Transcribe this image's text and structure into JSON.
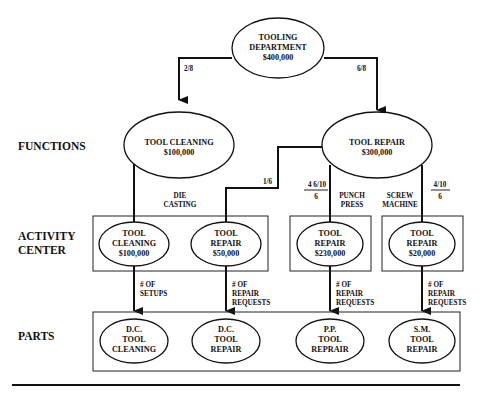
{
  "diagram": {
    "root": {
      "line1": "TOOLING",
      "line2": "DEPARTMENT",
      "line3": "$400,000"
    },
    "root_to_cleaning_ratio": "2/8",
    "root_to_repair_ratio": "6/8",
    "row_labels": {
      "functions": "FUNCTIONS",
      "activity1": "ACTIVITY",
      "activity2": "CENTER",
      "parts": "PARTS"
    },
    "functions": [
      {
        "line1": "TOOL CLEANING",
        "line2": "$100,000"
      },
      {
        "line1": "TOOL REPAIR",
        "line2": "$300,000"
      }
    ],
    "allocations": {
      "die_casting_ratio": "1/6",
      "punch_press_num": "4 6/10",
      "punch_press_den": "6",
      "screw_machine_num": "4/10",
      "screw_machine_den": "6"
    },
    "group_labels": {
      "die1": "DIE",
      "die2": "CASTING",
      "punch1": "PUNCH",
      "punch2": "PRESS",
      "screw1": "SCREW",
      "screw2": "MACHINE"
    },
    "activity_centers": [
      {
        "line1": "TOOL",
        "line2": "CLEANING",
        "line3": "$100,000"
      },
      {
        "line1": "TOOL",
        "line2": "REPAIR",
        "line3": "$50,000"
      },
      {
        "line1": "TOOL",
        "line2": "REPAIR",
        "line3": "$230,000"
      },
      {
        "line1": "TOOL",
        "line2": "REPAIR",
        "line3": "$20,000"
      }
    ],
    "drivers": [
      {
        "line1": "# OF",
        "line2": "SETUPS",
        "line3": ""
      },
      {
        "line1": "# OF",
        "line2": "REPAIR",
        "line3": "REQUESTS"
      },
      {
        "line1": "# OF",
        "line2": "REPAIR",
        "line3": "REQUESTS"
      },
      {
        "line1": "# OF",
        "line2": "REPAIR",
        "line3": "REQUESTS"
      }
    ],
    "parts": [
      {
        "line1": "D.C.",
        "line2": "TOOL",
        "line3": "CLEANING"
      },
      {
        "line1": "D.C.",
        "line2": "TOOL",
        "line3": "REPAIR"
      },
      {
        "line1": "P.P.",
        "line2": "TOOL",
        "line3": "REPRAIR"
      },
      {
        "line1": "S.M.",
        "line2": "TOOL",
        "line3": "REPAIR"
      }
    ]
  }
}
